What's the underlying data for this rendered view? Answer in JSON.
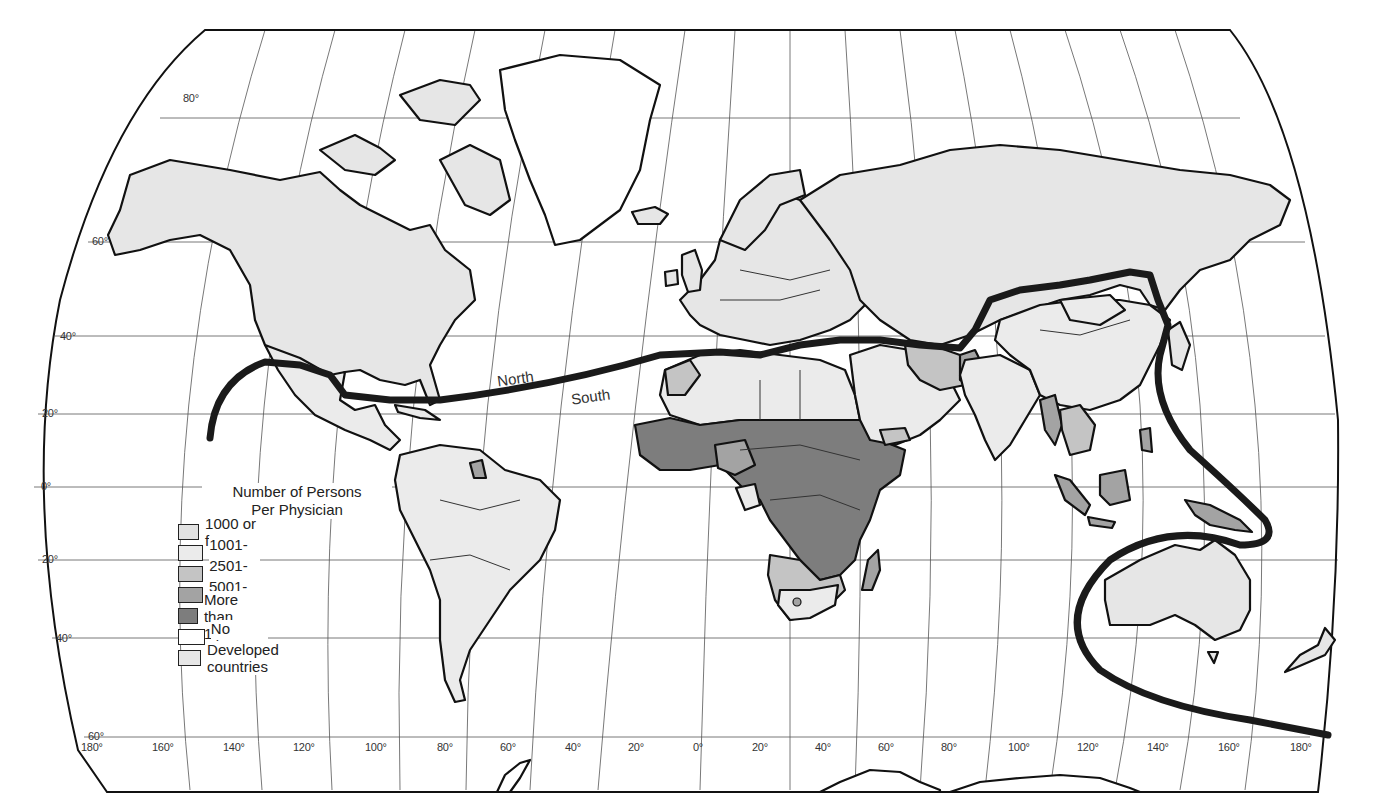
{
  "map": {
    "title": "Number of Persons Per Physician",
    "divide_labels": {
      "north": "North",
      "south": "South"
    },
    "colors": {
      "c1000_or_fewer": "#e2e2e2",
      "c1001_2500": "#ebebeb",
      "c2501_5000": "#c4c4c4",
      "c5001_10000": "#a3a3a3",
      "c_more_10000": "#7d7d7d",
      "no_data": "#ffffff",
      "developed": "#e6e6e6",
      "divide_line": "#1a1a1a"
    }
  },
  "legend": {
    "title_line1": "Number of Persons",
    "title_line2": "Per Physician",
    "items": [
      {
        "label": "1000 or fewer",
        "color": "#e2e2e2"
      },
      {
        "label": "1001-2500",
        "color": "#ebebeb"
      },
      {
        "label": "2501-5000",
        "color": "#c4c4c4"
      },
      {
        "label": "5001-10,000",
        "color": "#a3a3a3"
      },
      {
        "label": "More than 10,000",
        "color": "#7d7d7d"
      },
      {
        "label": "No data",
        "color": "#ffffff"
      },
      {
        "label": "Developed countries",
        "color": "#e6e6e6"
      }
    ]
  },
  "latitude_labels": [
    {
      "label": "80°"
    },
    {
      "label": "60°"
    },
    {
      "label": "40°"
    },
    {
      "label": "20°"
    },
    {
      "label": "0°"
    },
    {
      "label": "20°"
    },
    {
      "label": "40°"
    },
    {
      "label": "60°"
    }
  ],
  "longitude_labels": [
    {
      "label": "180°"
    },
    {
      "label": "160°"
    },
    {
      "label": "140°"
    },
    {
      "label": "120°"
    },
    {
      "label": "100°"
    },
    {
      "label": "80°"
    },
    {
      "label": "60°"
    },
    {
      "label": "40°"
    },
    {
      "label": "20°"
    },
    {
      "label": "0°"
    },
    {
      "label": "20°"
    },
    {
      "label": "40°"
    },
    {
      "label": "60°"
    },
    {
      "label": "80°"
    },
    {
      "label": "100°"
    },
    {
      "label": "120°"
    },
    {
      "label": "140°"
    },
    {
      "label": "160°"
    },
    {
      "label": "180°"
    }
  ]
}
